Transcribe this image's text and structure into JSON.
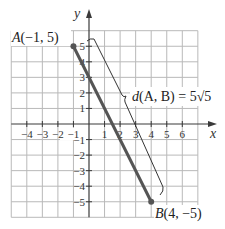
{
  "chart_data": {
    "type": "line",
    "title": "",
    "xlabel": "x",
    "ylabel": "y",
    "xlim": [
      -5,
      7
    ],
    "ylim": [
      -6,
      6
    ],
    "grid": true,
    "x_ticks": [
      -4,
      -3,
      -2,
      -1,
      1,
      2,
      3,
      4,
      5,
      6
    ],
    "x_tick_labels": [
      "−4",
      "−3",
      "−2",
      "−1",
      "1",
      "2",
      "3",
      "4",
      "5",
      "6"
    ],
    "y_ticks": [
      5,
      4,
      3,
      2,
      1,
      -1,
      -2,
      -3,
      -4,
      -5
    ],
    "y_tick_labels": [
      "5",
      "4",
      "3",
      "2",
      "1",
      "−1",
      "−2",
      "−3",
      "−4",
      "−5"
    ],
    "series": [
      {
        "name": "segment AB",
        "x": [
          -1,
          4
        ],
        "y": [
          5,
          -5
        ]
      }
    ],
    "points": [
      {
        "name": "A",
        "x": -1,
        "y": 5,
        "label": "A(−1, 5)"
      },
      {
        "name": "B",
        "x": 4,
        "y": -5,
        "label": "B(4, −5)"
      }
    ],
    "annotations": [
      {
        "type": "brace",
        "text": "d(A, B) = 5√5",
        "from": "A",
        "to": "B"
      }
    ]
  },
  "labels": {
    "x_axis": "x",
    "y_axis": "y",
    "point_a_name": "A",
    "point_a_coords": "(−1, 5)",
    "point_b_name": "B",
    "point_b_coords": "(4, −5)",
    "distance_d": "d",
    "distance_args": "(A, B)",
    "distance_eq": " = 5",
    "distance_radical": "√5",
    "distance_value": "5√5"
  }
}
